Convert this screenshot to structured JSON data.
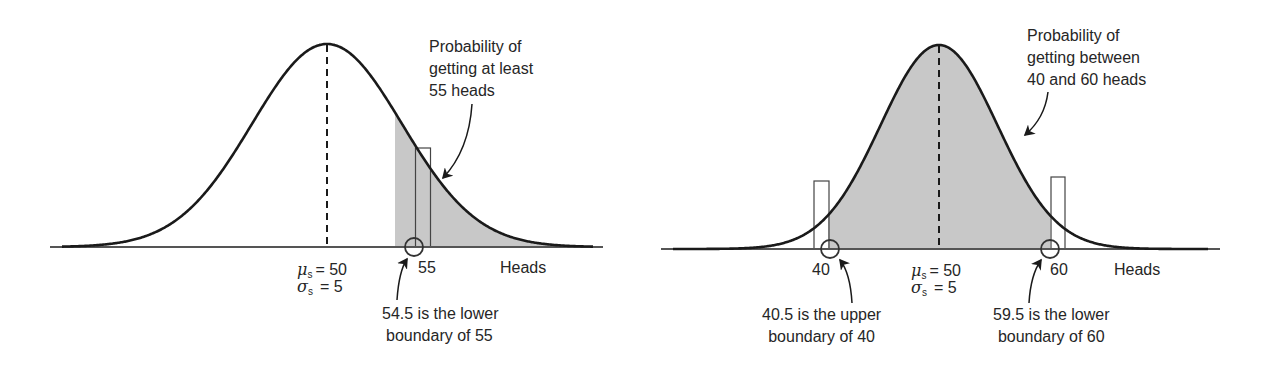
{
  "colors": {
    "curve": "#1a1a1a",
    "shade": "#c8c8c8",
    "axis": "#555555",
    "text": "#262626"
  },
  "chart_data": [
    {
      "type": "area",
      "title": "Normal approximation: P(at least 55 heads)",
      "xlabel": "Heads",
      "distribution": {
        "mean": 50,
        "sd": 5,
        "mean_label": "μs = 50",
        "sd_label": "σs = 5"
      },
      "tick_labels": [
        "55"
      ],
      "shaded_region": {
        "from": 54.5,
        "to": "infinity"
      },
      "highlight_bar": {
        "value": 55,
        "lower": 54.5,
        "upper": 55.5
      },
      "annotations": [
        "Probability of getting at least 55 heads",
        "54.5 is the lower boundary of 55"
      ]
    },
    {
      "type": "area",
      "title": "Normal approximation: P(between 40 and 60 heads)",
      "xlabel": "Heads",
      "distribution": {
        "mean": 50,
        "sd": 5,
        "mean_label": "μs = 50",
        "sd_label": "σs = 5"
      },
      "tick_labels": [
        "40",
        "60"
      ],
      "shaded_region": {
        "from": 40.5,
        "to": 59.5
      },
      "highlight_bars": [
        {
          "value": 40,
          "lower": 39.5,
          "upper": 40.5
        },
        {
          "value": 60,
          "lower": 59.5,
          "upper": 60.5
        }
      ],
      "annotations": [
        "Probability of getting between 40 and 60 heads",
        "40.5 is the upper boundary of 40",
        "59.5 is the lower boundary of 60"
      ]
    }
  ],
  "left": {
    "callout": [
      "Probability of",
      "getting at least",
      "55 heads"
    ],
    "tick": "55",
    "axis_label": "Heads",
    "mu": {
      "sym": "μ",
      "sub": "s",
      "rest": "= 50"
    },
    "sigma": {
      "sym": "σ",
      "sub": "s",
      "rest": "= 5"
    },
    "boundary_note": [
      "54.5 is the lower",
      "boundary of 55"
    ]
  },
  "right": {
    "callout": [
      "Probability of",
      "getting between",
      "40 and 60 heads"
    ],
    "tick_low": "40",
    "tick_high": "60",
    "axis_label": "Heads",
    "mu": {
      "sym": "μ",
      "sub": "s",
      "rest": "= 50"
    },
    "sigma": {
      "sym": "σ",
      "sub": "s",
      "rest": "= 5"
    },
    "note_low": [
      "40.5 is the upper",
      "boundary of 40"
    ],
    "note_high": [
      "59.5 is the lower",
      "boundary of 60"
    ]
  }
}
